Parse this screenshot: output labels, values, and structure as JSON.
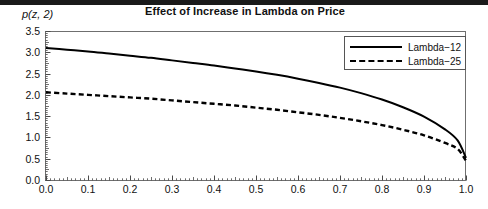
{
  "chart_data": {
    "type": "line",
    "title": "Effect of Increase in Lambda on Price",
    "xlabel": "",
    "ylabel": "p(z, 2)",
    "xlim": [
      0.0,
      1.0
    ],
    "ylim": [
      0.0,
      3.5
    ],
    "grid": false,
    "legend_position": "top-right",
    "xticks": [
      "0.0",
      "0.1",
      "0.2",
      "0.3",
      "0.4",
      "0.5",
      "0.6",
      "0.7",
      "0.8",
      "0.9",
      "1.0"
    ],
    "xtick_values": [
      0.0,
      0.1,
      0.2,
      0.3,
      0.4,
      0.5,
      0.6,
      0.7,
      0.8,
      0.9,
      1.0
    ],
    "yticks": [
      "0.0",
      "0.5",
      "1.0",
      "1.5",
      "2.0",
      "2.5",
      "3.0",
      "3.5"
    ],
    "ytick_values": [
      0.0,
      0.5,
      1.0,
      1.5,
      2.0,
      2.5,
      3.0,
      3.5
    ],
    "x": [
      0.0,
      0.05,
      0.1,
      0.15,
      0.2,
      0.25,
      0.3,
      0.35,
      0.4,
      0.45,
      0.5,
      0.55,
      0.6,
      0.65,
      0.7,
      0.75,
      0.8,
      0.85,
      0.9,
      0.95,
      0.98,
      1.0
    ],
    "series": [
      {
        "name": "Lambda-12",
        "style": "solid",
        "color": "#000000",
        "values": [
          3.1,
          3.06,
          3.02,
          2.97,
          2.92,
          2.87,
          2.81,
          2.75,
          2.69,
          2.62,
          2.55,
          2.47,
          2.38,
          2.28,
          2.17,
          2.04,
          1.89,
          1.71,
          1.49,
          1.19,
          0.93,
          0.52
        ]
      },
      {
        "name": "Lambda-25",
        "style": "dashed",
        "color": "#000000",
        "values": [
          2.06,
          2.03,
          2.0,
          1.97,
          1.94,
          1.91,
          1.87,
          1.83,
          1.79,
          1.75,
          1.7,
          1.65,
          1.59,
          1.53,
          1.46,
          1.38,
          1.29,
          1.18,
          1.05,
          0.87,
          0.73,
          0.45
        ]
      }
    ]
  },
  "legend": {
    "entries": [
      {
        "label": "Lambda−12",
        "style": "solid"
      },
      {
        "label": "Lambda−25",
        "style": "dashed"
      }
    ]
  }
}
